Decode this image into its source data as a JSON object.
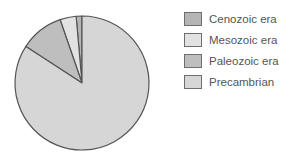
{
  "chart_data": {
    "type": "pie",
    "title": "",
    "categories": [
      "Cenozoic era",
      "Mesozoic era",
      "Paleozoic era",
      "Precambrian"
    ],
    "values": [
      1.4,
      3.9,
      10.5,
      84.2
    ],
    "units": "percent of geologic time (estimated)",
    "colors": [
      "#b5b5b5",
      "#e2e2e2",
      "#bebebe",
      "#d6d6d6"
    ],
    "start_angle_deg": 0,
    "direction": "counterclockwise",
    "legend_position": "right"
  },
  "legend": {
    "items": [
      {
        "label": "Cenozoic era",
        "color": "#b5b5b5"
      },
      {
        "label": "Mesozoic era",
        "color": "#e2e2e2"
      },
      {
        "label": "Paleozoic era",
        "color": "#bebebe"
      },
      {
        "label": "Precambrian",
        "color": "#d6d6d6"
      }
    ]
  }
}
